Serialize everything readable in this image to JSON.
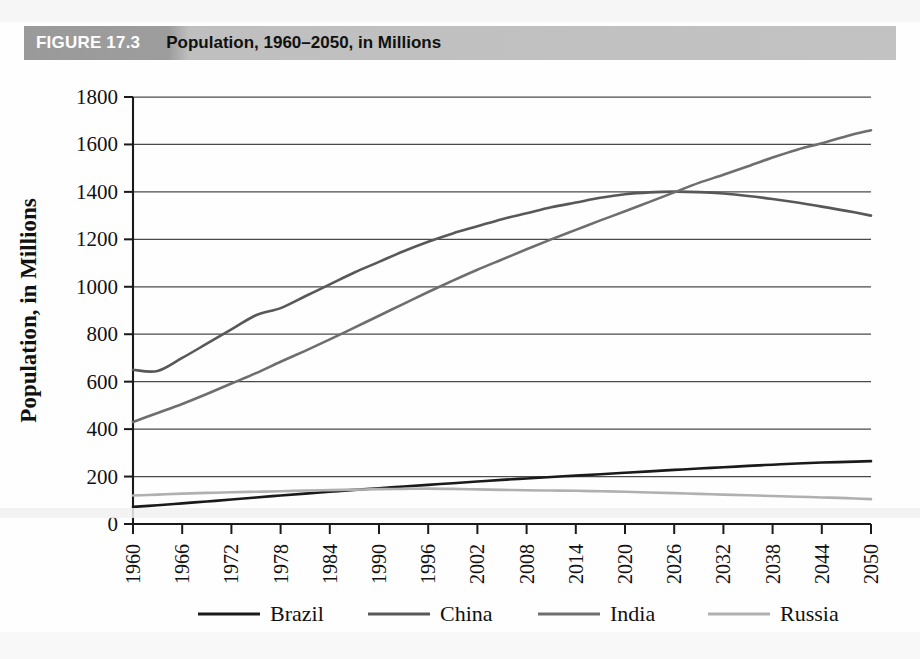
{
  "header": {
    "figure_number": "FIGURE 17.3",
    "title": "Population, 1960–2050, in Millions",
    "band_dark_color": "#9a9a9a",
    "band_light_color": "#c2c2c2",
    "number_color": "#ffffff",
    "title_color": "#111111"
  },
  "chart_data": {
    "type": "line",
    "title": "Population, 1960–2050, in Millions",
    "xlabel": "",
    "ylabel": "Population, in Millions",
    "xlim": [
      1960,
      2050
    ],
    "ylim": [
      0,
      1800
    ],
    "grid": true,
    "legend_position": "bottom",
    "ytick_labels": [
      "0",
      "200",
      "400",
      "600",
      "800",
      "1000",
      "1200",
      "1400",
      "1600",
      "1800"
    ],
    "ytick_values": [
      0,
      200,
      400,
      600,
      800,
      1000,
      1200,
      1400,
      1600,
      1800
    ],
    "xtick_labels": [
      "1960",
      "1966",
      "1972",
      "1978",
      "1984",
      "1990",
      "1996",
      "2002",
      "2008",
      "2014",
      "2020",
      "2026",
      "2032",
      "2038",
      "2044",
      "2050"
    ],
    "xtick_values": [
      1960,
      1966,
      1972,
      1978,
      1984,
      1990,
      1996,
      2002,
      2008,
      2014,
      2020,
      2026,
      2032,
      2038,
      2044,
      2050
    ],
    "x": [
      1960,
      1963,
      1966,
      1969,
      1972,
      1975,
      1978,
      1981,
      1984,
      1987,
      1990,
      1993,
      1996,
      1999,
      2002,
      2005,
      2008,
      2011,
      2014,
      2017,
      2020,
      2023,
      2026,
      2029,
      2032,
      2035,
      2038,
      2041,
      2044,
      2047,
      2050
    ],
    "series": [
      {
        "name": "Brazil",
        "color": "#1a1a1a",
        "values": [
          72,
          79,
          87,
          95,
          103,
          112,
          120,
          128,
          136,
          144,
          151,
          158,
          165,
          172,
          179,
          186,
          192,
          198,
          204,
          210,
          216,
          222,
          228,
          234,
          239,
          245,
          250,
          255,
          259,
          262,
          265
        ]
      },
      {
        "name": "China",
        "color": "#585858",
        "values": [
          650,
          645,
          700,
          760,
          820,
          880,
          910,
          960,
          1010,
          1060,
          1105,
          1150,
          1190,
          1225,
          1255,
          1285,
          1310,
          1335,
          1355,
          1375,
          1390,
          1398,
          1401,
          1399,
          1393,
          1383,
          1370,
          1355,
          1338,
          1320,
          1300
        ]
      },
      {
        "name": "India",
        "color": "#6e6e6e",
        "values": [
          430,
          468,
          506,
          548,
          592,
          636,
          684,
          730,
          778,
          828,
          878,
          928,
          978,
          1026,
          1072,
          1115,
          1158,
          1200,
          1240,
          1280,
          1318,
          1358,
          1398,
          1438,
          1472,
          1508,
          1545,
          1578,
          1605,
          1635,
          1660
        ]
      },
      {
        "name": "Russia",
        "color": "#b0b0b0",
        "values": [
          120,
          124,
          128,
          131,
          134,
          136,
          138,
          141,
          143,
          145,
          147,
          148,
          149,
          148,
          146,
          144,
          142,
          141,
          140,
          138,
          136,
          133,
          130,
          127,
          124,
          121,
          118,
          115,
          112,
          109,
          105
        ]
      }
    ]
  },
  "legend": {
    "items": [
      {
        "label": "Brazil",
        "color": "#1a1a1a"
      },
      {
        "label": "China",
        "color": "#585858"
      },
      {
        "label": "India",
        "color": "#6e6e6e"
      },
      {
        "label": "Russia",
        "color": "#b0b0b0"
      }
    ]
  }
}
